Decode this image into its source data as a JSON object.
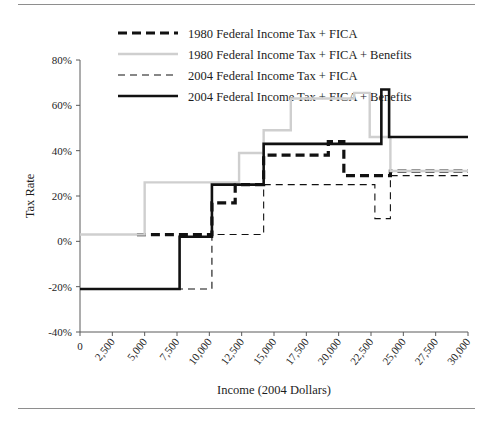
{
  "figure": {
    "has_top_rule": true,
    "has_bottom_rule": true,
    "rule_color": "#8e8e8e",
    "background": "#ffffff"
  },
  "chart_data": {
    "type": "line",
    "subtype": "step",
    "title": "",
    "xlabel": "Income (2004 Dollars)",
    "ylabel": "Tax Rate",
    "xlim": [
      0,
      30000
    ],
    "ylim": [
      -40,
      80
    ],
    "grid": false,
    "legend_position": "top-center",
    "xticks": [
      0,
      2500,
      5000,
      7500,
      10000,
      12500,
      15000,
      17500,
      20000,
      22500,
      25000,
      27500,
      30000
    ],
    "xtick_labels": [
      "0",
      "2,500",
      "5,000",
      "7,500",
      "10,000",
      "12,500",
      "15,000",
      "17,500",
      "20,000",
      "22,500",
      "25,000",
      "27,500",
      "30,000"
    ],
    "yticks": [
      -40,
      -20,
      0,
      20,
      40,
      60,
      80
    ],
    "ytick_labels": [
      "-40%",
      "-20%",
      "0%",
      "20%",
      "40%",
      "60%",
      "80%"
    ],
    "series": [
      {
        "name": "1980 Federal Income Tax + FICA",
        "key": "tax1980",
        "color": "#111111",
        "width": 3.2,
        "dash": "9,5",
        "points": [
          [
            4400,
            3
          ],
          [
            10200,
            3
          ],
          [
            10200,
            17
          ],
          [
            12000,
            17
          ],
          [
            12000,
            25
          ],
          [
            14200,
            25
          ],
          [
            14200,
            38
          ],
          [
            19200,
            38
          ],
          [
            19200,
            44
          ],
          [
            20400,
            44
          ],
          [
            20400,
            29
          ],
          [
            24000,
            29
          ],
          [
            24000,
            31
          ],
          [
            30000,
            31
          ]
        ]
      },
      {
        "name": "1980 Federal Income Tax + FICA + Benefits",
        "key": "tax1980ben",
        "color": "#cfcfcf",
        "width": 2.4,
        "dash": "none",
        "points": [
          [
            0,
            3
          ],
          [
            5000,
            3
          ],
          [
            5000,
            26
          ],
          [
            12300,
            26
          ],
          [
            12300,
            39
          ],
          [
            14200,
            39
          ],
          [
            14200,
            49
          ],
          [
            16300,
            49
          ],
          [
            16300,
            63
          ],
          [
            21200,
            63
          ],
          [
            21200,
            65.5
          ],
          [
            22400,
            65.5
          ],
          [
            22400,
            46
          ],
          [
            24000,
            46
          ],
          [
            24000,
            31
          ],
          [
            30000,
            31
          ]
        ]
      },
      {
        "name": "2004 Federal Income Tax + FICA",
        "key": "tax2004",
        "color": "#111111",
        "width": 1.1,
        "dash": "7,5",
        "points": [
          [
            0,
            -21
          ],
          [
            10200,
            -21
          ],
          [
            10200,
            3
          ],
          [
            14200,
            3
          ],
          [
            14200,
            25
          ],
          [
            22800,
            25
          ],
          [
            22800,
            10
          ],
          [
            24000,
            10
          ],
          [
            24000,
            29
          ],
          [
            30000,
            29
          ]
        ]
      },
      {
        "name": "2004 Federal Income Tax + FICA + Benefits",
        "key": "tax2004ben",
        "color": "#111111",
        "width": 2.6,
        "dash": "none",
        "points": [
          [
            0,
            -21
          ],
          [
            7700,
            -21
          ],
          [
            7700,
            2
          ],
          [
            10200,
            2
          ],
          [
            10200,
            25
          ],
          [
            14200,
            25
          ],
          [
            14200,
            43
          ],
          [
            23300,
            43
          ],
          [
            23300,
            67
          ],
          [
            23900,
            67
          ],
          [
            23900,
            46
          ],
          [
            30000,
            46
          ]
        ]
      }
    ]
  },
  "legend": {
    "entries": [
      {
        "label": "1980 Federal Income Tax + FICA",
        "color": "#111111",
        "width": 3.2,
        "dash": "9,5"
      },
      {
        "label": "1980 Federal Income Tax + FICA + Benefits",
        "color": "#cfcfcf",
        "width": 2.4,
        "dash": "none"
      },
      {
        "label": "2004 Federal Income Tax + FICA",
        "color": "#111111",
        "width": 1.1,
        "dash": "7,5"
      },
      {
        "label": "2004 Federal Income Tax + FICA + Benefits",
        "color": "#111111",
        "width": 2.6,
        "dash": "none"
      }
    ]
  }
}
